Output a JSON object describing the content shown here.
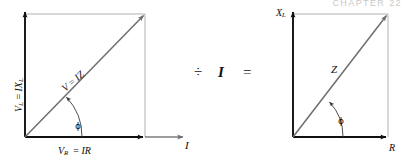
{
  "figure": {
    "running_head": "CHAPTER 22",
    "background_color": "#ffffff",
    "ink_color": "#101010",
    "construction_line_color": "#9a9a9a",
    "phasor_line_color": "#6e6e6e",
    "caption_equation": "voltage phasor triangle divided by I gives impedance triangle"
  },
  "operators": {
    "divide_symbol": "÷",
    "current_symbol": "I",
    "equals_symbol": "="
  },
  "voltage_triangle": {
    "name": "voltage-phasor-triangle",
    "vertical_axis_label_main": "V",
    "vertical_axis_label_sub": "L",
    "vertical_axis_label_rhs": "IX",
    "vertical_axis_label_rhs_sub": "L",
    "vertical_axis_label_full": "V_L = IX_L",
    "horizontal_axis_label_main": "V",
    "horizontal_axis_label_sub": "R",
    "horizontal_axis_label_rhs": "IR",
    "horizontal_axis_label_full": "V_R = IR",
    "hypotenuse_label": "V = IZ",
    "hypotenuse_label_lhs": "V",
    "hypotenuse_label_rhs": "IZ",
    "angle_label": "ϕ",
    "current_axis_label": "I",
    "angle_degrees": 40.5
  },
  "impedance_triangle": {
    "name": "impedance-triangle",
    "vertical_axis_label_main": "X",
    "vertical_axis_label_sub": "L",
    "vertical_axis_label_full": "X_L",
    "horizontal_axis_label": "R",
    "hypotenuse_label": "Z",
    "angle_label": "ϕ",
    "angle_degrees": 40.5
  }
}
